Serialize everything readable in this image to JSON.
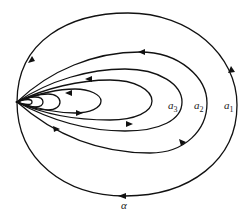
{
  "diagram": {
    "type": "phase-portrait",
    "labels": {
      "a3": {
        "base": "a",
        "sub": "3"
      },
      "a2": {
        "base": "a",
        "sub": "2"
      },
      "a1": {
        "base": "a",
        "sub": "1"
      },
      "alpha": "α"
    },
    "singular_point": [
      17,
      102
    ],
    "orbit_count": 7,
    "stroke_color": "#111111"
  }
}
